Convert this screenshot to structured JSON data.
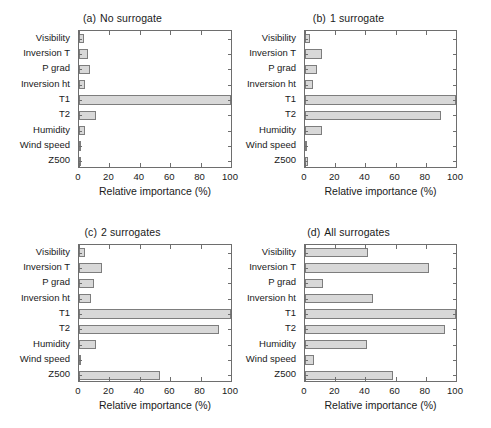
{
  "figure": {
    "background": "#ffffff",
    "bar_fill": "#d8d8d8",
    "bar_edge": "#7d7d7d",
    "axis_color": "#6e6e6e",
    "text_color": "#1a1a1a"
  },
  "chart_data": [
    {
      "type": "bar",
      "orientation": "horizontal",
      "panel": "a",
      "title": "(a)  No surrogate",
      "title_tag": "(a)",
      "title_text": "No surrogate",
      "categories": [
        "Visibility",
        "Inversion T",
        "P grad",
        "Inversion ht",
        "T1",
        "T2",
        "Humidity",
        "Wind speed",
        "Z500"
      ],
      "values": [
        3,
        6,
        7,
        4,
        100,
        11,
        4,
        1,
        1
      ],
      "xlabel": "Relative importance (%)",
      "ylabel": "",
      "xlim": [
        0,
        100
      ],
      "xticks": [
        0,
        20,
        40,
        60,
        80,
        100
      ],
      "xticklabels": [
        "0",
        "20",
        "40",
        "60",
        "80",
        "100"
      ],
      "grid": false,
      "legend": null
    },
    {
      "type": "bar",
      "orientation": "horizontal",
      "panel": "b",
      "title": "(b)  1 surrogate",
      "title_tag": "(b)",
      "title_text": "1 surrogate",
      "categories": [
        "Visibility",
        "Inversion T",
        "P grad",
        "Inversion ht",
        "T1",
        "T2",
        "Humidity",
        "Wind speed",
        "Z500"
      ],
      "values": [
        3,
        11,
        8,
        5,
        100,
        90,
        11,
        1,
        2
      ],
      "xlabel": "Relative importance (%)",
      "ylabel": "",
      "xlim": [
        0,
        100
      ],
      "xticks": [
        0,
        20,
        40,
        60,
        80,
        100
      ],
      "xticklabels": [
        "0",
        "20",
        "40",
        "60",
        "80",
        "100"
      ],
      "grid": false,
      "legend": null
    },
    {
      "type": "bar",
      "orientation": "horizontal",
      "panel": "c",
      "title": "(c)  2 surrogates",
      "title_tag": "(c)",
      "title_text": "2 surrogates",
      "categories": [
        "Visibility",
        "Inversion T",
        "P grad",
        "Inversion ht",
        "T1",
        "T2",
        "Humidity",
        "Wind speed",
        "Z500"
      ],
      "values": [
        4,
        15,
        10,
        8,
        100,
        92,
        11,
        1,
        53
      ],
      "xlabel": "Relative importance (%)",
      "ylabel": "",
      "xlim": [
        0,
        100
      ],
      "xticks": [
        0,
        20,
        40,
        60,
        80,
        100
      ],
      "xticklabels": [
        "0",
        "20",
        "40",
        "60",
        "80",
        "100"
      ],
      "grid": false,
      "legend": null
    },
    {
      "type": "bar",
      "orientation": "horizontal",
      "panel": "d",
      "title": "(d)  All surrogates",
      "title_tag": "(d)",
      "title_text": "All surrogates",
      "categories": [
        "Visibility",
        "Inversion T",
        "P grad",
        "Inversion ht",
        "T1",
        "T2",
        "Humidity",
        "Wind speed",
        "Z500"
      ],
      "values": [
        42,
        82,
        12,
        45,
        100,
        93,
        41,
        6,
        58
      ],
      "xlabel": "Relative importance (%)",
      "ylabel": "",
      "xlim": [
        0,
        100
      ],
      "xticks": [
        0,
        20,
        40,
        60,
        80,
        100
      ],
      "xticklabels": [
        "0",
        "20",
        "40",
        "60",
        "80",
        "100"
      ],
      "grid": false,
      "legend": null
    }
  ]
}
